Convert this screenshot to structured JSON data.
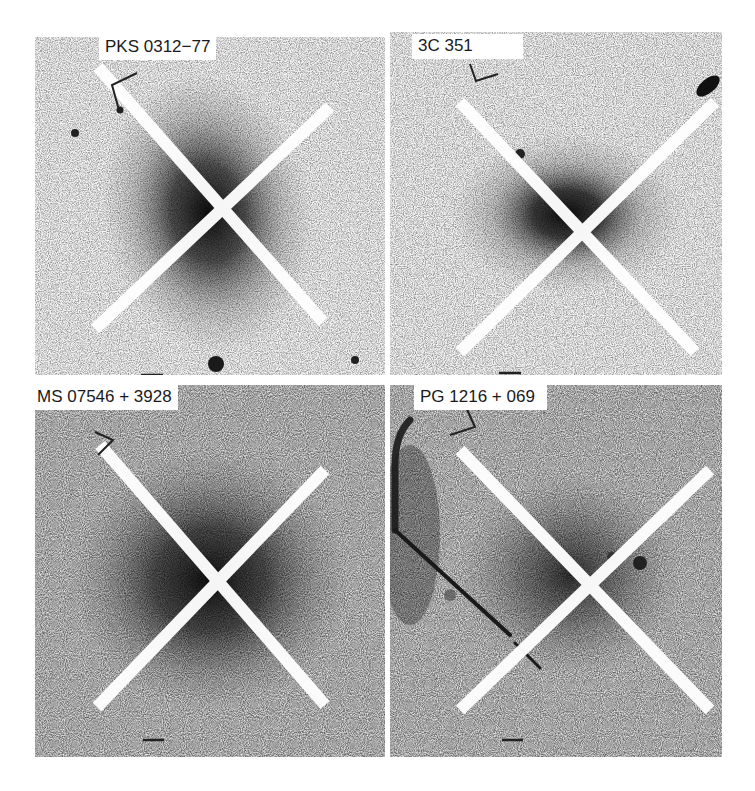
{
  "figure": {
    "panels": [
      {
        "id": "pks",
        "label": "PKS 0312−77",
        "x": 35,
        "y": 37,
        "w": 350,
        "h": 338,
        "cx": 208,
        "cy": 213,
        "core": "#0d0d0d",
        "label_pos": [
          64,
          10
        ]
      },
      {
        "id": "3c",
        "label": "3C 351",
        "x": 390,
        "y": 32,
        "w": 332,
        "h": 343,
        "cx": 567,
        "cy": 212,
        "core": "#0d0d0d",
        "label_pos": [
          26,
          4
        ]
      },
      {
        "id": "ms",
        "label": "MS 07546 + 3928",
        "x": 35,
        "y": 385,
        "w": 350,
        "h": 372,
        "cx": 210,
        "cy": 580,
        "core": "#141414",
        "label_pos": [
          0,
          0
        ]
      },
      {
        "id": "pg",
        "label": "PG 1216 + 069",
        "x": 390,
        "y": 385,
        "w": 332,
        "h": 372,
        "cx": 570,
        "cy": 580,
        "core": "#262626",
        "label_pos": [
          24,
          0
        ]
      }
    ],
    "scale_bar_icon": "scale-bar-icon",
    "compass_icon": "orientation-arrow-icon"
  }
}
